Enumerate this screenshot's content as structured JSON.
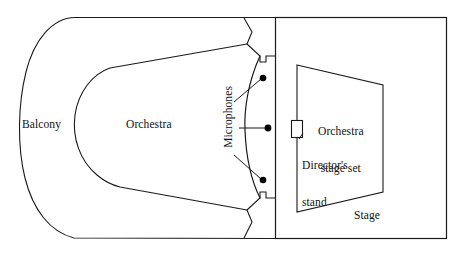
{
  "figure": {
    "kind": "floor-plan-diagram",
    "stroke_color": "#1a1a1a",
    "background_color": "#ffffff"
  },
  "labels": {
    "balcony": "Balcony",
    "orchestra": "Orchestra",
    "microphones": "Microphones",
    "orchestra_stage_set_line1": "Orchestra",
    "orchestra_stage_set_line2": "stage set",
    "directors_stand_line1": "Director's",
    "directors_stand_line2": "stand",
    "stage": "Stage"
  },
  "microphones": {
    "count": 3,
    "positions": [
      {
        "x": 263,
        "y": 78
      },
      {
        "x": 268,
        "y": 128
      },
      {
        "x": 263,
        "y": 180
      }
    ]
  },
  "regions": [
    {
      "name": "balcony",
      "shape": "outer U-shaped seating ring"
    },
    {
      "name": "orchestra",
      "shape": "inner U-shaped seating area"
    },
    {
      "name": "stage",
      "shape": "rectangle right of divider"
    },
    {
      "name": "orchestra-stage-set",
      "shape": "trapezoid inside stage"
    },
    {
      "name": "directors-stand",
      "shape": "small rectangle on stage set left edge"
    }
  ]
}
